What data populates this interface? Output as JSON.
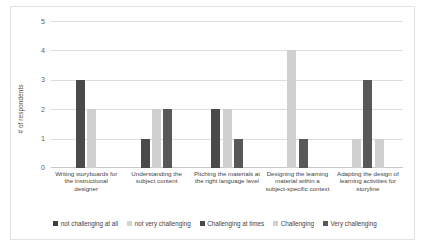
{
  "chart_data": {
    "type": "bar",
    "title": "",
    "xlabel": "",
    "ylabel": "# of respondents",
    "ylim": [
      0,
      5
    ],
    "yticks": [
      "0",
      "1",
      "2",
      "3",
      "4",
      "5"
    ],
    "grid": true,
    "legend_position": "bottom",
    "categories": [
      "Writing storyboards for the instructional designer",
      "Understanding the subject content",
      "Pitching the materials at the right language level",
      "Designing the learning material within a subject-specific context",
      "Adapting the design of learning activities for storyline"
    ],
    "series": [
      {
        "name": "not challenging at all",
        "color": "#3f3f3f",
        "values": [
          0,
          0,
          0,
          0,
          0
        ]
      },
      {
        "name": "not very challenging",
        "color": "#d4d4d4",
        "values": [
          0,
          0,
          0,
          0,
          0
        ]
      },
      {
        "name": "Challenging at times",
        "color": "#4a4a4a",
        "values": [
          3,
          1,
          2,
          0,
          0
        ]
      },
      {
        "name": "Challenging",
        "color": "#d0d0d0",
        "values": [
          2,
          2,
          2,
          4,
          1
        ]
      },
      {
        "name": "Very challenging",
        "color": "#585858",
        "values": [
          0,
          2,
          1,
          1,
          3
        ]
      }
    ],
    "extra_series": [
      {
        "name": "trailing light bar",
        "color": "#d0d0d0",
        "values": [
          0,
          0,
          0,
          0,
          1
        ]
      }
    ]
  },
  "legend": {
    "items": [
      {
        "label": "not challenging at all",
        "color": "#3f3f3f"
      },
      {
        "label": "not very challenging",
        "color": "#d4d4d4"
      },
      {
        "label": "Challenging at times",
        "color": "#4a4a4a"
      },
      {
        "label": "Challenging",
        "color": "#d0d0d0"
      },
      {
        "label": "Very challenging",
        "color": "#585858"
      }
    ]
  },
  "axis": {
    "y_title": "# of respondents",
    "y_labels": [
      "5",
      "4",
      "3",
      "2",
      "1",
      "0"
    ]
  }
}
